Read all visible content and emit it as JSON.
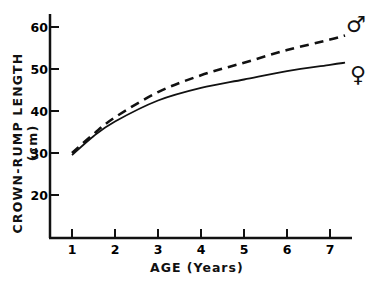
{
  "chart_data": {
    "type": "line",
    "title": "",
    "xlabel": "AGE (Years)",
    "ylabel": "CROWN-RUMP LENGTH (cm)",
    "xlim": [
      0.6,
      7.5
    ],
    "ylim": [
      10,
      64
    ],
    "x_ticks": [
      1,
      2,
      3,
      4,
      5,
      6,
      7
    ],
    "x_tick_labels": [
      "1",
      "2",
      "3",
      "4",
      "5",
      "6",
      "7"
    ],
    "y_ticks": [
      20,
      30,
      40,
      50,
      60
    ],
    "y_tick_labels": [
      "20",
      "30",
      "40",
      "50",
      "60"
    ],
    "grid": false,
    "x": [
      1,
      1.5,
      2,
      3,
      4,
      5,
      6,
      7,
      7.35
    ],
    "series": [
      {
        "name": "Male",
        "symbol": "♂",
        "style": "dashed",
        "values": [
          30,
          34.5,
          38.5,
          44.5,
          48.5,
          51.5,
          54.5,
          57,
          58
        ]
      },
      {
        "name": "Female",
        "symbol": "♀",
        "style": "solid",
        "values": [
          29.5,
          34,
          37.5,
          42.5,
          45.5,
          47.5,
          49.5,
          51,
          51.5
        ]
      }
    ],
    "legend": "inline symbols at right end of curves"
  }
}
